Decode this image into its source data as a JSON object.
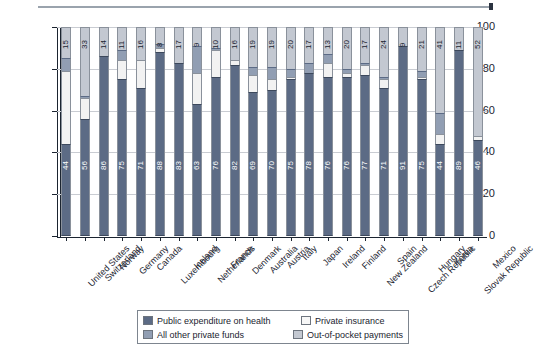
{
  "chart_data": {
    "type": "bar",
    "subtype": "stacked-bar-100pct",
    "title": "",
    "xlabel": "",
    "ylabel": "Percent",
    "ylim": [
      0,
      100
    ],
    "yticks": [
      0,
      20,
      40,
      60,
      80,
      100
    ],
    "grid": true,
    "legend_position": "bottom-center",
    "categories": [
      "United States",
      "Switzerland",
      "Norway",
      "Germany",
      "Canada",
      "Luxembourg",
      "Iceland",
      "Netherlands",
      "France",
      "Denmark",
      "Australia",
      "Austria",
      "Italy",
      "Japan",
      "Ireland",
      "Finland",
      "New Zealand",
      "Spain",
      "Czech Republic",
      "Hungary",
      "Korea",
      "Slovak Republic",
      "Mexico"
    ],
    "series": [
      {
        "name": "Public expenditure on health",
        "color": "#5c6b85",
        "values": [
          44,
          56,
          86,
          75,
          71,
          88,
          83,
          63,
          76,
          82,
          69,
          70,
          75,
          78,
          76,
          76,
          77,
          71,
          91,
          75,
          44,
          89,
          46
        ]
      },
      {
        "name": "Private insurance",
        "color": "#f2f2f2",
        "values": [
          35,
          10,
          0,
          9,
          13,
          2,
          0,
          15,
          13,
          2,
          8,
          5,
          1,
          0,
          7,
          2,
          5,
          4,
          0,
          1,
          5,
          0,
          2
        ]
      },
      {
        "name": "All other private funds",
        "color": "#919eb3",
        "values": [
          6,
          1,
          0,
          5,
          0,
          2,
          0,
          13,
          1,
          0,
          4,
          6,
          4,
          5,
          4,
          2,
          1,
          1,
          0,
          3,
          10,
          0,
          0
        ]
      },
      {
        "name": "Out-of-pocket payments",
        "color": "#c3c8d1",
        "values": [
          15,
          33,
          14,
          11,
          16,
          8,
          17,
          9,
          10,
          16,
          19,
          19,
          20,
          17,
          13,
          20,
          17,
          24,
          9,
          21,
          41,
          11,
          52
        ]
      }
    ],
    "labels_top": [
      15,
      33,
      14,
      11,
      16,
      8,
      17,
      9,
      10,
      16,
      19,
      19,
      20,
      17,
      13,
      20,
      17,
      24,
      9,
      21,
      41,
      11,
      52
    ],
    "labels_bottom": [
      44,
      56,
      86,
      75,
      71,
      88,
      83,
      63,
      76,
      82,
      69,
      70,
      75,
      78,
      76,
      76,
      77,
      71,
      91,
      75,
      44,
      89,
      46
    ]
  },
  "legend": {
    "items": [
      {
        "label": "Public expenditure on health",
        "swatch": "public"
      },
      {
        "label": "Private insurance",
        "swatch": "privateins"
      },
      {
        "label": "All other private funds",
        "swatch": "otherfunds"
      },
      {
        "label": "Out-of-pocket payments",
        "swatch": "oop"
      }
    ]
  }
}
